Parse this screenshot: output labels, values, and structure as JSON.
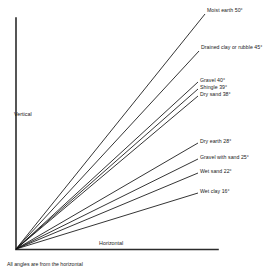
{
  "chart_data": {
    "type": "line",
    "title": "",
    "subtitle": "",
    "xlabel": "Horizontal",
    "ylabel": "Vertical",
    "footnote": "All angles are from the horizontal",
    "angle_unit": "degrees",
    "grid": false,
    "legend_position": "inline-right",
    "origin": {
      "x": 16,
      "y": 249
    },
    "axis": {
      "vertical_top_y": 18,
      "horizontal_right_x": 218,
      "color": "#2b2b2b"
    },
    "series": [
      {
        "name": "Moist earth",
        "label": "Moist earth 50°",
        "angle": 50,
        "end": {
          "x": 205,
          "y": 14
        },
        "label_x": 207,
        "label_y": 12
      },
      {
        "name": "Drained clay or rubble",
        "label": "Drained clay or rubble 45°",
        "angle": 45,
        "end": {
          "x": 199,
          "y": 51
        },
        "label_x": 201,
        "label_y": 49
      },
      {
        "name": "Gravel",
        "label": "Gravel 40°",
        "angle": 40,
        "end": {
          "x": 198,
          "y": 82
        },
        "label_x": 200,
        "label_y": 82
      },
      {
        "name": "Shingle",
        "label": "Shingle 39°",
        "angle": 39,
        "end": {
          "x": 198,
          "y": 89
        },
        "label_x": 200,
        "label_y": 89
      },
      {
        "name": "Dry sand",
        "label": "Dry sand 38°",
        "angle": 38,
        "end": {
          "x": 198,
          "y": 96
        },
        "label_x": 200,
        "label_y": 96
      },
      {
        "name": "Dry earth",
        "label": "Dry earth 28°",
        "angle": 28,
        "end": {
          "x": 198,
          "y": 143
        },
        "label_x": 200,
        "label_y": 143
      },
      {
        "name": "Gravel with sand",
        "label": "Gravel with sand 25°",
        "angle": 25,
        "end": {
          "x": 198,
          "y": 159
        },
        "label_x": 200,
        "label_y": 159
      },
      {
        "name": "Wet sand",
        "label": "Wet sand 22°",
        "angle": 22,
        "end": {
          "x": 198,
          "y": 173
        },
        "label_x": 200,
        "label_y": 173
      },
      {
        "name": "Wet clay",
        "label": "Wet clay 16°",
        "angle": 16,
        "end": {
          "x": 198,
          "y": 193
        },
        "label_x": 200,
        "label_y": 193
      }
    ],
    "axis_label_positions": {
      "vertical": {
        "x": 14,
        "y": 116
      },
      "horizontal": {
        "x": 99,
        "y": 245
      },
      "footnote": {
        "x": 7,
        "y": 266
      }
    }
  }
}
